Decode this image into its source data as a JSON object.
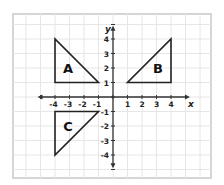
{
  "diagram": {
    "type": "coordinate-plane",
    "frame": {
      "x": 13,
      "y": 14,
      "w": 198,
      "h": 164,
      "color": "#c8c8c8"
    },
    "origin_px": {
      "x": 113,
      "y": 97
    },
    "unit_px": 14.5,
    "x_range": [
      -4,
      4
    ],
    "y_range": [
      -4,
      4
    ],
    "axis_labels": {
      "x": "x",
      "y": "y"
    },
    "x_ticks": [
      "-4",
      "-3",
      "-2",
      "-1",
      "1",
      "2",
      "3",
      "4"
    ],
    "y_ticks": [
      "4",
      "3",
      "2",
      "1",
      "-1",
      "-2",
      "-3",
      "-4"
    ],
    "grid_color": "#e6e6e6",
    "axis_color": "#333333",
    "shape_color": "#222222",
    "shapes": [
      {
        "label": "A",
        "vertices": [
          [
            -4,
            4
          ],
          [
            -4,
            1
          ],
          [
            -1,
            1
          ]
        ],
        "label_pos": [
          -3.1,
          2
        ]
      },
      {
        "label": "B",
        "vertices": [
          [
            1,
            1
          ],
          [
            4,
            1
          ],
          [
            4,
            4
          ]
        ],
        "label_pos": [
          3.1,
          2
        ]
      },
      {
        "label": "C",
        "vertices": [
          [
            -4,
            -1
          ],
          [
            -1,
            -1
          ],
          [
            -4,
            -4
          ]
        ],
        "label_pos": [
          -3.1,
          -2
        ]
      }
    ]
  }
}
